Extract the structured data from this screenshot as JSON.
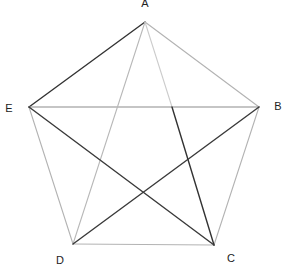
{
  "diagram": {
    "type": "pentagon-with-diagonals",
    "vertices": [
      {
        "id": "A",
        "label": "A"
      },
      {
        "id": "B",
        "label": "B"
      },
      {
        "id": "C",
        "label": "C"
      },
      {
        "id": "D",
        "label": "D"
      },
      {
        "id": "E",
        "label": "E"
      }
    ],
    "edges": [
      {
        "id": "AB",
        "from": "A",
        "to": "B",
        "style": "light",
        "color": "#b3b3b3"
      },
      {
        "id": "BC",
        "from": "B",
        "to": "C",
        "style": "light",
        "color": "#b3b3b3"
      },
      {
        "id": "CD",
        "from": "C",
        "to": "D",
        "style": "light",
        "color": "#b3b3b3"
      },
      {
        "id": "DE",
        "from": "D",
        "to": "E",
        "style": "light",
        "color": "#b3b3b3"
      },
      {
        "id": "EA",
        "from": "E",
        "to": "A",
        "style": "dark",
        "color": "#333333"
      },
      {
        "id": "EB",
        "from": "E",
        "to": "B",
        "style": "medium",
        "color": "#8c8c8c"
      },
      {
        "id": "AD",
        "from": "A",
        "to": "D",
        "style": "light",
        "color": "#b8b8b8"
      },
      {
        "id": "AF",
        "from": "A",
        "to": "F",
        "style": "light",
        "color": "#cccccc"
      },
      {
        "id": "FC",
        "from": "F",
        "to": "C",
        "style": "dark",
        "color": "#333333"
      },
      {
        "id": "EC",
        "from": "E",
        "to": "C",
        "style": "dark",
        "color": "#3a3a3a"
      },
      {
        "id": "DB",
        "from": "D",
        "to": "B",
        "style": "dark",
        "color": "#3a3a3a"
      }
    ]
  }
}
